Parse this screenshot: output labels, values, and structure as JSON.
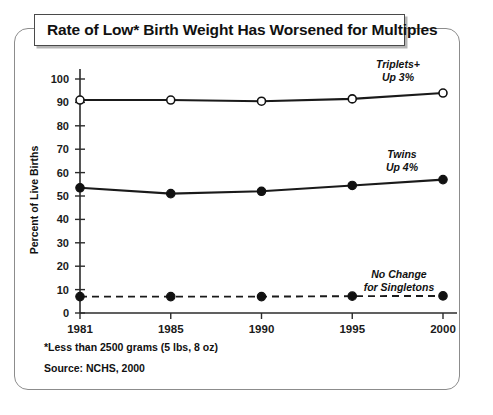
{
  "figure": {
    "title": "Rate of Low* Birth Weight Has Worsened for Multiples",
    "footnote_asterisk": "*Less than 2500 grams (5 lbs, 8 oz)",
    "source": "Source: NCHS, 2000"
  },
  "chart_data": {
    "type": "line",
    "title": "Rate of Low* Birth Weight Has Worsened for Multiples",
    "xlabel": "",
    "ylabel": "Percent of Live Births",
    "categories": [
      "1981",
      "1985",
      "1990",
      "1995",
      "2000"
    ],
    "x": [
      1981,
      1985,
      1990,
      1995,
      2000
    ],
    "ylim": [
      0,
      100
    ],
    "yticks": [
      0,
      10,
      20,
      30,
      40,
      50,
      60,
      70,
      80,
      90,
      100
    ],
    "ytick_labels": [
      "0",
      "10",
      "20",
      "30",
      "40",
      "50",
      "60",
      "70",
      "80",
      "90",
      "100"
    ],
    "grid": false,
    "legend": "none",
    "series": [
      {
        "name": "Triplets+",
        "values": [
          91,
          91,
          90.5,
          91.5,
          94
        ],
        "marker": "open-circle",
        "line_style": "solid",
        "color": "#111111",
        "annotation": "Triplets+\nUp 3%",
        "annotation_line_1": "Triplets+",
        "annotation_line_2": "Up 3%"
      },
      {
        "name": "Twins",
        "values": [
          53.5,
          51,
          52,
          54.5,
          57
        ],
        "marker": "filled-circle",
        "line_style": "solid",
        "color": "#111111",
        "annotation": "Twins\nUp 4%",
        "annotation_line_1": "Twins",
        "annotation_line_2": "Up 4%"
      },
      {
        "name": "Singletons",
        "values": [
          7,
          7,
          7,
          7.2,
          7.3
        ],
        "marker": "filled-circle",
        "line_style": "dashed",
        "color": "#111111",
        "annotation": "No Change\nfor Singletons",
        "annotation_line_1": "No Change",
        "annotation_line_2": "for Singletons"
      }
    ]
  }
}
